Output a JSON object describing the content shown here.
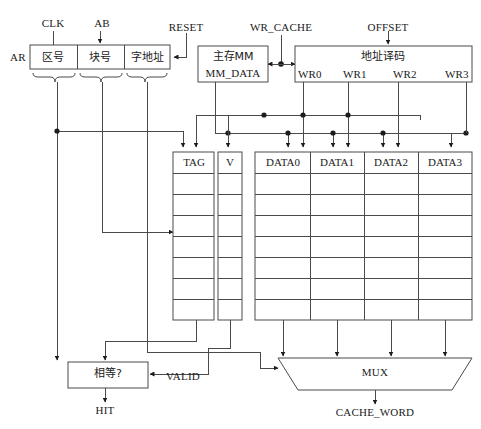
{
  "diagram": {
    "type": "block-diagram",
    "colors": {
      "line": "#4a4a4a",
      "text": "#1a1a1a",
      "background": "#ffffff",
      "junction": "#1c1c1c"
    }
  },
  "address_register": {
    "name_label": "AR",
    "fields": [
      {
        "label": "区号",
        "meaning": "zone-number"
      },
      {
        "label": "块号",
        "meaning": "block-number"
      },
      {
        "label": "字地址",
        "meaning": "word-address"
      }
    ]
  },
  "control_signals": {
    "clk": "CLK",
    "ab": "AB",
    "reset": "RESET",
    "wr_cache": "WR_CACHE",
    "offset": "OFFSET"
  },
  "main_memory": {
    "line1": "主存MM",
    "line2": "MM_DATA"
  },
  "address_decoder": {
    "title": "地址译码",
    "outputs": [
      "WR0",
      "WR1",
      "WR2",
      "WR3"
    ]
  },
  "tag_table": {
    "header": "TAG",
    "rows": 7
  },
  "valid_table": {
    "header": "V",
    "rows": 7
  },
  "data_table": {
    "headers": [
      "DATA0",
      "DATA1",
      "DATA2",
      "DATA3"
    ],
    "rows": 7
  },
  "comparator": {
    "label": "相等?",
    "output": "HIT",
    "input_signal": "VALID"
  },
  "mux": {
    "label": "MUX",
    "output": "CACHE_WORD",
    "input_count": 4
  }
}
